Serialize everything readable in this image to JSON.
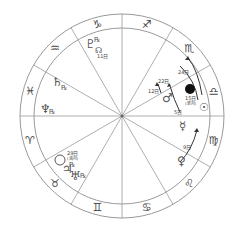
{
  "chart": {
    "center": [
      122,
      116
    ],
    "outer_radius": 102,
    "inner_radius": 88,
    "line_color": "#9a9a9a",
    "signs": [
      {
        "name": "aries",
        "glyph": "♈",
        "angle": 195
      },
      {
        "name": "taurus",
        "glyph": "♉",
        "angle": 225
      },
      {
        "name": "gemini",
        "glyph": "♊",
        "angle": 255
      },
      {
        "name": "cancer",
        "glyph": "♋",
        "angle": 285
      },
      {
        "name": "leo",
        "glyph": "♌",
        "angle": 315
      },
      {
        "name": "virgo",
        "glyph": "♍",
        "angle": 345
      },
      {
        "name": "libra",
        "glyph": "♎",
        "angle": 15
      },
      {
        "name": "scorpio",
        "glyph": "♏",
        "angle": 45
      },
      {
        "name": "sagittarius",
        "glyph": "♐",
        "angle": 75
      },
      {
        "name": "capricorn",
        "glyph": "♑",
        "angle": 105
      },
      {
        "name": "aquarius",
        "glyph": "♒",
        "angle": 135
      },
      {
        "name": "pisces",
        "glyph": "♓",
        "angle": 165
      }
    ],
    "planets": {
      "pluto": {
        "glyph": "♇",
        "retro": "℞"
      },
      "moon_node": {
        "glyph": "☊",
        "label": "11日"
      },
      "saturn": {
        "glyph": "♄",
        "retro": "℞"
      },
      "neptune": {
        "glyph": "♆",
        "retro": "℞"
      },
      "mars": {
        "glyph": "♂",
        "labels": [
          "12日",
          "22日"
        ]
      },
      "new_moon": {
        "label": "15日",
        "sub": "(新月)"
      },
      "sun": {
        "glyph": "☉",
        "label": "24日"
      },
      "mercury": {
        "glyph": "☿",
        "label": "5日"
      },
      "venus": {
        "glyph": "♀",
        "label": "9日"
      },
      "full_moon": {
        "label": "29日",
        "sub": "(満月)"
      },
      "jupiter": {
        "glyph": "♃",
        "retro": "℞"
      },
      "uranus": {
        "glyph": "♅",
        "retro": "℞"
      }
    }
  }
}
